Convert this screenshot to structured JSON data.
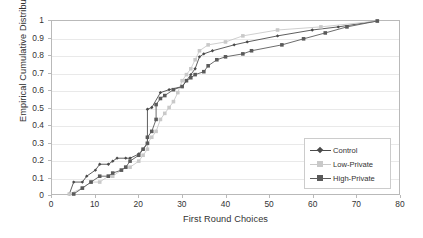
{
  "chart_data": {
    "type": "line",
    "title": "",
    "xlabel": "First Round Choices",
    "ylabel": "Empirical Cumulative Distribution",
    "xlim": [
      0,
      80
    ],
    "ylim": [
      0,
      1
    ],
    "xticks": [
      "0",
      "10",
      "20",
      "30",
      "40",
      "50",
      "60",
      "70",
      "80"
    ],
    "yticks": [
      "0",
      "0.1",
      "0.2",
      "0.3",
      "0.4",
      "0.5",
      "0.6",
      "0.7",
      "0.8",
      "0.9",
      "1"
    ],
    "grid": "horizontal",
    "legend_position": "bottom-right",
    "series": [
      {
        "name": "Control",
        "color": "#4a4a4a",
        "marker": "diamond",
        "points": [
          [
            4,
            0.0
          ],
          [
            5,
            0.069
          ],
          [
            7,
            0.069
          ],
          [
            8,
            0.103
          ],
          [
            10,
            0.138
          ],
          [
            11,
            0.172
          ],
          [
            13,
            0.172
          ],
          [
            14,
            0.19
          ],
          [
            15,
            0.207
          ],
          [
            17,
            0.207
          ],
          [
            18,
            0.207
          ],
          [
            20,
            0.231
          ],
          [
            21,
            0.259
          ],
          [
            22,
            0.293
          ],
          [
            22,
            0.328
          ],
          [
            22,
            0.49
          ],
          [
            23,
            0.5
          ],
          [
            25,
            0.586
          ],
          [
            27,
            0.603
          ],
          [
            30,
            0.621
          ],
          [
            31,
            0.655
          ],
          [
            32,
            0.69
          ],
          [
            33,
            0.724
          ],
          [
            34,
            0.793
          ],
          [
            35,
            0.81
          ],
          [
            37,
            0.828
          ],
          [
            42,
            0.862
          ],
          [
            45,
            0.879
          ],
          [
            52,
            0.914
          ],
          [
            60,
            0.948
          ],
          [
            66,
            0.966
          ],
          [
            75,
            1.0
          ]
        ]
      },
      {
        "name": "Low-Private",
        "color": "#c9c9c9",
        "marker": "square",
        "points": [
          [
            4,
            0.0
          ],
          [
            7,
            0.034
          ],
          [
            9,
            0.069
          ],
          [
            11,
            0.069
          ],
          [
            13,
            0.103
          ],
          [
            14,
            0.103
          ],
          [
            16,
            0.138
          ],
          [
            17,
            0.155
          ],
          [
            18,
            0.155
          ],
          [
            20,
            0.19
          ],
          [
            21,
            0.224
          ],
          [
            22,
            0.259
          ],
          [
            22,
            0.293
          ],
          [
            23,
            0.328
          ],
          [
            24,
            0.362
          ],
          [
            25,
            0.431
          ],
          [
            26,
            0.466
          ],
          [
            27,
            0.5
          ],
          [
            28,
            0.534
          ],
          [
            29,
            0.586
          ],
          [
            30,
            0.655
          ],
          [
            31,
            0.69
          ],
          [
            32,
            0.724
          ],
          [
            33,
            0.776
          ],
          [
            34,
            0.828
          ],
          [
            36,
            0.862
          ],
          [
            40,
            0.879
          ],
          [
            44,
            0.914
          ],
          [
            52,
            0.948
          ],
          [
            62,
            0.966
          ],
          [
            75,
            1.0
          ]
        ]
      },
      {
        "name": "High-Private",
        "color": "#5a5a5a",
        "marker": "square",
        "points": [
          [
            5,
            0.0
          ],
          [
            7,
            0.034
          ],
          [
            9,
            0.069
          ],
          [
            11,
            0.103
          ],
          [
            13,
            0.103
          ],
          [
            14,
            0.121
          ],
          [
            16,
            0.138
          ],
          [
            17,
            0.155
          ],
          [
            18,
            0.19
          ],
          [
            20,
            0.224
          ],
          [
            21,
            0.259
          ],
          [
            22,
            0.293
          ],
          [
            22,
            0.328
          ],
          [
            23,
            0.362
          ],
          [
            24,
            0.431
          ],
          [
            24,
            0.517
          ],
          [
            25,
            0.552
          ],
          [
            26,
            0.569
          ],
          [
            28,
            0.603
          ],
          [
            30,
            0.621
          ],
          [
            31,
            0.655
          ],
          [
            32,
            0.672
          ],
          [
            33,
            0.69
          ],
          [
            35,
            0.707
          ],
          [
            36,
            0.741
          ],
          [
            38,
            0.776
          ],
          [
            40,
            0.793
          ],
          [
            44,
            0.81
          ],
          [
            46,
            0.828
          ],
          [
            53,
            0.862
          ],
          [
            58,
            0.897
          ],
          [
            63,
            0.931
          ],
          [
            68,
            0.966
          ],
          [
            75,
            1.0
          ]
        ]
      }
    ]
  },
  "legend": {
    "entries": [
      {
        "label": "Control"
      },
      {
        "label": "Low-Private"
      },
      {
        "label": "High-Private"
      }
    ]
  }
}
